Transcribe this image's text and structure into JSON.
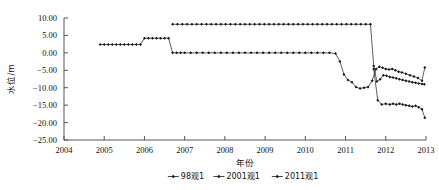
{
  "chart_data": {
    "type": "line",
    "title": "",
    "xlabel": "年份",
    "ylabel": "水位/m",
    "xlim": [
      2004,
      2013
    ],
    "ylim": [
      -25.0,
      10.0
    ],
    "xticks": [
      2004,
      2005,
      2006,
      2007,
      2008,
      2009,
      2010,
      2011,
      2012,
      2013
    ],
    "xtick_labels": [
      "2004",
      "2005",
      "2006",
      "2007",
      "2008",
      "2009",
      "2010",
      "2011",
      "2012",
      "2013"
    ],
    "yticks": [
      10.0,
      5.0,
      0.0,
      -5.0,
      -10.0,
      -15.0,
      -20.0,
      -25.0
    ],
    "ytick_labels": [
      "10.00",
      "5.00",
      "0.00",
      "-5.00",
      "-10.00",
      "-15.00",
      "-20.00",
      "-25.00"
    ],
    "grid": false,
    "legend_position": "bottom-center",
    "marker": "diamond",
    "line_color": "#1a1a1a",
    "series": [
      {
        "name": "98观1",
        "x": [
          2006.7,
          2006.82,
          2006.94,
          2007.06,
          2007.18,
          2007.3,
          2007.42,
          2007.54,
          2007.66,
          2007.78,
          2007.9,
          2008.02,
          2008.14,
          2008.26,
          2008.38,
          2008.5,
          2008.62,
          2008.74,
          2008.86,
          2008.98,
          2009.1,
          2009.22,
          2009.34,
          2009.46,
          2009.58,
          2009.7,
          2009.82,
          2009.94,
          2010.06,
          2010.18,
          2010.3,
          2010.42,
          2010.54,
          2010.66,
          2010.78,
          2010.9,
          2011.02,
          2011.14,
          2011.26,
          2011.38,
          2011.5,
          2011.62,
          2011.7,
          2011.78,
          2011.86,
          2011.94,
          2012.02,
          2012.1,
          2012.18,
          2012.26,
          2012.34,
          2012.42,
          2012.5,
          2012.58,
          2012.66,
          2012.74,
          2012.82,
          2012.9,
          2012.96
        ],
        "y": [
          8.2,
          8.2,
          8.2,
          8.2,
          8.2,
          8.2,
          8.2,
          8.2,
          8.2,
          8.2,
          8.2,
          8.2,
          8.2,
          8.2,
          8.2,
          8.2,
          8.2,
          8.2,
          8.2,
          8.2,
          8.2,
          8.2,
          8.2,
          8.2,
          8.2,
          8.2,
          8.2,
          8.2,
          8.2,
          8.2,
          8.2,
          8.2,
          8.2,
          8.2,
          8.2,
          8.2,
          8.2,
          8.2,
          8.2,
          8.2,
          8.2,
          8.2,
          -3.8,
          -8.2,
          -7.6,
          -6.4,
          -6.6,
          -6.9,
          -7.1,
          -7.3,
          -7.6,
          -7.8,
          -8.0,
          -8.2,
          -8.4,
          -8.6,
          -8.8,
          -8.9,
          -9.0
        ]
      },
      {
        "name": "2001观1",
        "x": [
          2004.9,
          2005.0,
          2005.1,
          2005.2,
          2005.3,
          2005.4,
          2005.5,
          2005.6,
          2005.7,
          2005.8,
          2005.9,
          2006.0,
          2006.1,
          2006.2,
          2006.3,
          2006.4,
          2006.5,
          2006.6,
          2006.7,
          2006.8,
          2006.9,
          2007.0,
          2007.15,
          2007.3,
          2007.45,
          2007.6,
          2007.75,
          2007.9,
          2008.05,
          2008.2,
          2008.35,
          2008.5,
          2008.65,
          2008.8,
          2008.95,
          2009.1,
          2009.25,
          2009.4,
          2009.55,
          2009.7,
          2009.85,
          2010.0,
          2010.15,
          2010.3,
          2010.45,
          2010.6,
          2010.75,
          2010.86,
          2010.96,
          2011.06,
          2011.16,
          2011.26,
          2011.36,
          2011.46,
          2011.56,
          2011.66,
          2011.76,
          2011.84,
          2011.92,
          2012.0,
          2012.08,
          2012.16,
          2012.24,
          2012.32,
          2012.4,
          2012.5,
          2012.6,
          2012.7,
          2012.8,
          2012.9,
          2012.97
        ],
        "y": [
          2.4,
          2.4,
          2.4,
          2.4,
          2.4,
          2.4,
          2.4,
          2.4,
          2.4,
          2.4,
          2.4,
          4.2,
          4.2,
          4.2,
          4.2,
          4.2,
          4.2,
          4.2,
          0.0,
          0.0,
          0.0,
          0.0,
          0.0,
          0.0,
          0.0,
          0.0,
          0.0,
          0.0,
          0.0,
          0.0,
          0.0,
          0.0,
          0.0,
          0.0,
          0.0,
          0.0,
          0.0,
          0.0,
          0.0,
          0.0,
          0.0,
          0.0,
          0.0,
          0.0,
          0.0,
          0.0,
          -0.2,
          -2.5,
          -6.2,
          -7.8,
          -8.4,
          -9.8,
          -10.2,
          -10.0,
          -9.8,
          -8.0,
          -4.6,
          -4.0,
          -4.3,
          -4.6,
          -4.8,
          -4.6,
          -5.0,
          -5.4,
          -5.6,
          -6.0,
          -6.4,
          -6.8,
          -7.2,
          -8.0,
          -4.2
        ]
      },
      {
        "name": "2011观1",
        "x": [
          2011.7,
          2011.8,
          2011.9,
          2012.0,
          2012.1,
          2012.18,
          2012.26,
          2012.34,
          2012.42,
          2012.5,
          2012.58,
          2012.66,
          2012.74,
          2012.82,
          2012.9,
          2012.97
        ],
        "y": [
          -4.6,
          -13.6,
          -14.8,
          -14.6,
          -14.8,
          -14.6,
          -14.8,
          -14.6,
          -14.8,
          -15.0,
          -15.2,
          -15.4,
          -15.2,
          -15.6,
          -16.2,
          -18.6
        ]
      }
    ]
  },
  "legend": {
    "items": [
      {
        "label": "98观1"
      },
      {
        "label": "2001观1"
      },
      {
        "label": "2011观1"
      }
    ]
  }
}
